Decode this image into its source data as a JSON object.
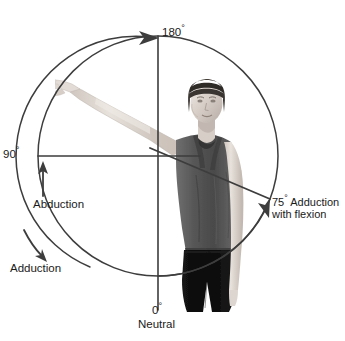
{
  "figure": {
    "background_color": "#ffffff",
    "line_color": "#3d3d3d",
    "text_color": "#1a1a1a",
    "photo": {
      "subject": "woman standing, right arm abducted overhead, grayscale photograph",
      "grayscale": true
    }
  },
  "geometry": {
    "center_x": 158,
    "center_y": 156,
    "radius": 120,
    "vertical_axis_x": 158,
    "horizontal_axis_y": 156,
    "adduction_line_angle_deg": -15
  },
  "labels": {
    "top": {
      "value": "180",
      "degree": "°"
    },
    "left": {
      "value": "90",
      "degree": "°"
    },
    "abduction": "Abduction",
    "adduction": "Adduction",
    "right_line1_value": "75",
    "right_line1_degree": "°",
    "right_line1_text": " Adduction",
    "right_line2": "with flexion",
    "bottom_value": "0",
    "bottom_degree": "°",
    "bottom_text": "Neutral"
  },
  "markers": {
    "arc_abduction_arrow": "arrowhead-up-at-180",
    "straight_arrow_abduction": "arrow-up",
    "curved_arrow_adduction": "arrow-down-curved",
    "arc_adduction_arrow": "arrowhead-up-right-at-75"
  }
}
